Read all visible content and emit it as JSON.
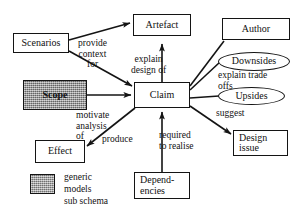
{
  "diagram": {
    "colors": {
      "stroke": "#141414",
      "background": "#ffffff",
      "shaded_fill": "#9a9a9a"
    },
    "nodes": [
      {
        "id": "scenarios",
        "label": "Scenarios",
        "shape": "rect",
        "shaded": false
      },
      {
        "id": "scope",
        "label": "Scope",
        "shape": "rect",
        "shaded": true
      },
      {
        "id": "artefact",
        "label": "Artefact",
        "shape": "rect",
        "shaded": false
      },
      {
        "id": "claim",
        "label": "Claim",
        "shape": "rect",
        "shaded": false
      },
      {
        "id": "author",
        "label": "Author",
        "shape": "rect",
        "shaded": false
      },
      {
        "id": "downsides",
        "label": "Downsides",
        "shape": "ellipse",
        "shaded": false
      },
      {
        "id": "upsides",
        "label": "Upsides",
        "shape": "ellipse",
        "shaded": false
      },
      {
        "id": "design-issue",
        "label": "Design\nissue",
        "shape": "rect",
        "shaded": false
      },
      {
        "id": "effect",
        "label": "Effect",
        "shape": "rect",
        "shaded": false
      },
      {
        "id": "dependencies",
        "label": "Depend-\nencies",
        "shape": "rect",
        "shaded": false
      }
    ],
    "edge_labels": [
      {
        "id": "provide-context-for",
        "text": "provide\ncontext\nfor",
        "from": "scenarios",
        "to": "artefact"
      },
      {
        "id": "explain-design-of",
        "text": "explain\ndesign of",
        "from": "claim",
        "to": "artefact"
      },
      {
        "id": "motivate-analysis-of",
        "text": "motivate\nanalysis\nof",
        "from": "scope",
        "to": "claim"
      },
      {
        "id": "explain-trade-offs",
        "text": "explain trade\noffs",
        "from": "claim",
        "to": "downsides"
      },
      {
        "id": "suggest",
        "text": "suggest",
        "from": "claim",
        "to": "design-issue"
      },
      {
        "id": "produce",
        "text": "produce",
        "from": "claim",
        "to": "effect"
      },
      {
        "id": "required-to-realise",
        "text": "required\nto realise",
        "from": "dependencies",
        "to": "claim"
      }
    ],
    "legend": {
      "swatch_name": "shaded-fill-swatch",
      "text": "generic\nmodels\nsub schema"
    }
  }
}
